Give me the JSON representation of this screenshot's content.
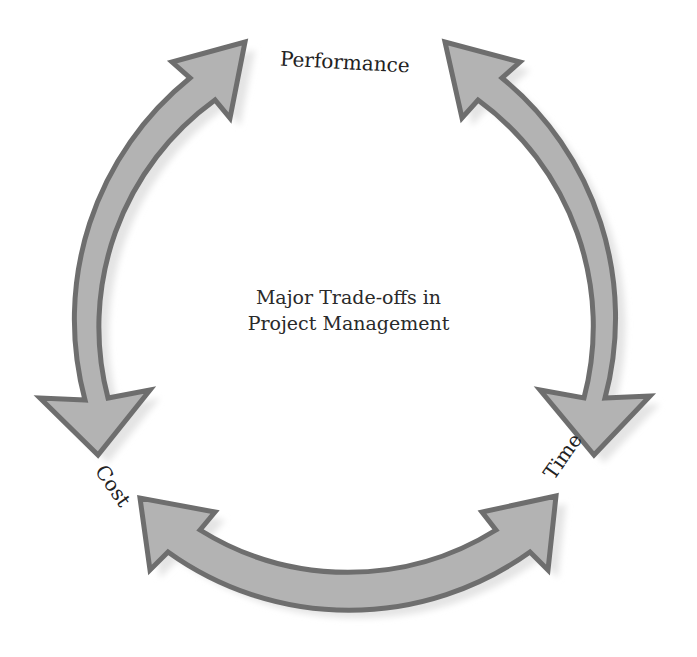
{
  "diagram": {
    "type": "cycle",
    "title_lines": [
      "Major Trade-offs in",
      "Project Management"
    ],
    "nodes": [
      {
        "id": "performance",
        "label": "Performance",
        "position": "top"
      },
      {
        "id": "time",
        "label": "Time",
        "position": "bottom-right"
      },
      {
        "id": "cost",
        "label": "Cost",
        "position": "bottom-left"
      }
    ],
    "edges": [
      {
        "from": "cost",
        "to": "performance",
        "style": "double-headed curved arrow",
        "side": "left"
      },
      {
        "from": "performance",
        "to": "time",
        "style": "double-headed curved arrow",
        "side": "right"
      },
      {
        "from": "cost",
        "to": "time",
        "style": "double-headed curved arrow",
        "side": "bottom"
      }
    ],
    "colors": {
      "arrow_fill": "#b3b3b3",
      "arrow_stroke": "#6e6e6e",
      "shadow": "#e6e6e6",
      "text": "#222222"
    }
  }
}
